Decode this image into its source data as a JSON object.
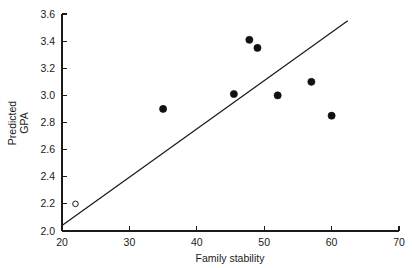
{
  "chart_data": {
    "type": "scatter",
    "title": "",
    "xlabel": "Family stability",
    "ylabel": "Predicted GPA",
    "ylabel_line1": "Predicted",
    "ylabel_line2": "GPA",
    "xlim": [
      20,
      70
    ],
    "ylim": [
      2.0,
      3.6
    ],
    "xticks": [
      20,
      30,
      40,
      50,
      60,
      70
    ],
    "yticks": [
      2.0,
      2.2,
      2.4,
      2.6,
      2.8,
      3.0,
      3.2,
      3.4,
      3.6
    ],
    "xtick_labels": [
      "20",
      "30",
      "40",
      "50",
      "60",
      "70"
    ],
    "ytick_labels": [
      "2.0",
      "2.2",
      "2.4",
      "2.6",
      "2.8",
      "3.0",
      "3.2",
      "3.4",
      "3.6"
    ],
    "grid": false,
    "legend": false,
    "series": [
      {
        "name": "observations",
        "marker": "filled-circle",
        "color": "#111111",
        "points": [
          {
            "x": 35.0,
            "y": 2.9
          },
          {
            "x": 45.5,
            "y": 3.01
          },
          {
            "x": 47.8,
            "y": 3.41
          },
          {
            "x": 49.0,
            "y": 3.35
          },
          {
            "x": 52.0,
            "y": 3.0
          },
          {
            "x": 57.0,
            "y": 3.1
          },
          {
            "x": 60.0,
            "y": 2.85
          }
        ]
      },
      {
        "name": "outlier",
        "marker": "open-circle",
        "color": "#1a1a1a",
        "points": [
          {
            "x": 22.0,
            "y": 2.2
          }
        ]
      }
    ],
    "annotations": [
      {
        "type": "regression-line",
        "x1": 20.0,
        "y1": 2.04,
        "x2": 62.4,
        "y2": 3.55
      }
    ]
  },
  "colors": {
    "axis": "#1a1a1a",
    "marker_filled": "#111111",
    "marker_open_stroke": "#1a1a1a",
    "background": "#ffffff"
  }
}
